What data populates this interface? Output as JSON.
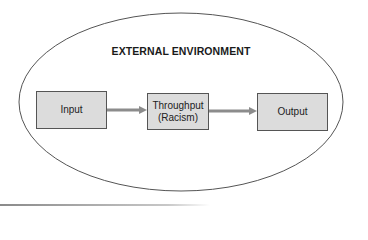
{
  "diagram": {
    "environment_label": "EXTERNAL ENVIRONMENT",
    "nodes": [
      {
        "id": "input",
        "label": "Input"
      },
      {
        "id": "throughput",
        "label_line1": "Throughput",
        "label_line2": "(Racism)"
      },
      {
        "id": "output",
        "label": "Output"
      }
    ],
    "edges": [
      {
        "from": "input",
        "to": "throughput"
      },
      {
        "from": "throughput",
        "to": "output"
      }
    ],
    "colors": {
      "box_fill": "#dcdcdc",
      "box_border": "#555555",
      "arrow": "#8c8c8c",
      "ellipse_stroke": "#555555"
    }
  }
}
